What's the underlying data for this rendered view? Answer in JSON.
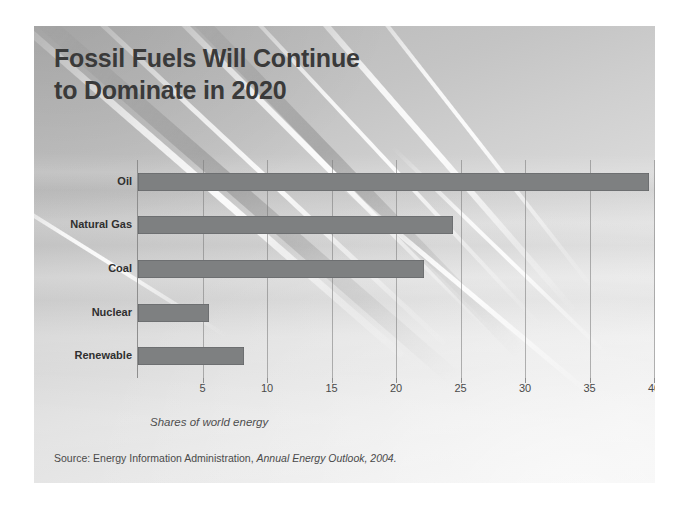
{
  "slide": {
    "title_lines": [
      "Fossil Fuels Will Continue",
      "to Dominate in 2020"
    ],
    "source_prefix": "Source: Energy Information Administration,",
    "source_italic": "Annual Energy Outlook, 2004.",
    "background": {
      "description": "grayscale photograph of glass-and-cable building facade with diagonal light streaks",
      "base_color": "#c8c8c8",
      "streak_color": "#ffffff"
    }
  },
  "chart_data": {
    "type": "bar",
    "orientation": "horizontal",
    "title": "Fossil Fuels Will Continue to Dominate in 2020",
    "xlabel": "Shares of world energy",
    "ylabel": "",
    "categories": [
      "Oil",
      "Natural Gas",
      "Coal",
      "Nuclear",
      "Renewable"
    ],
    "values": [
      39.6,
      24.4,
      22.2,
      5.5,
      8.2
    ],
    "xlim": [
      0,
      40
    ],
    "xticks": [
      5,
      10,
      15,
      20,
      25,
      30,
      35,
      40
    ],
    "xtick_labels": [
      "5",
      "10",
      "15",
      "20",
      "25",
      "30",
      "35",
      "40"
    ],
    "grid": "vertical gridlines at each x tick",
    "legend": "none",
    "bar_color": "#7e8081",
    "axis_color": "#8e8e8e",
    "gridline_color": "#787878"
  },
  "colors": {
    "title_text": "#3a3a3a",
    "label_text": "#2f2f2f",
    "tick_text": "#4a4a4a",
    "bar_fill": "#7e8081",
    "slide_background": "#c8c8c8",
    "page_background": "#ffffff"
  }
}
